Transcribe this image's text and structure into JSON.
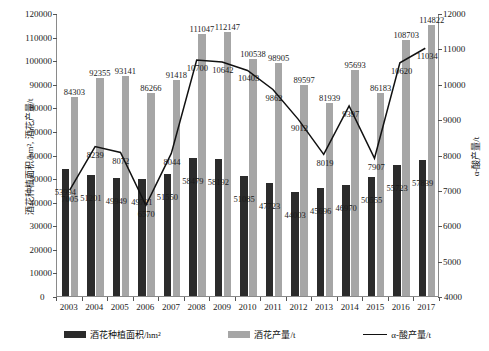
{
  "chart_data": {
    "type": "bar",
    "title": "",
    "xlabel": "",
    "ylabel": "酒花种植面积/hm², 酒花产量/t",
    "ylabel_right": "α-酸产量/t",
    "categories": [
      "2003",
      "2004",
      "2005",
      "2006",
      "2007",
      "2008",
      "2009",
      "2010",
      "2011",
      "2012",
      "2013",
      "2014",
      "2015",
      "2016",
      "2017"
    ],
    "ylim": [
      0,
      120000
    ],
    "yticks": [
      0,
      10000,
      20000,
      30000,
      40000,
      50000,
      60000,
      70000,
      80000,
      90000,
      100000,
      110000,
      120000
    ],
    "ylim_right": [
      4000,
      12000
    ],
    "yticks_right": [
      4000,
      5000,
      6000,
      7000,
      8000,
      9000,
      10000,
      11000,
      12000
    ],
    "grid": false,
    "legend_position": "bottom",
    "series": [
      {
        "name": "酒花种植面积/hm²",
        "type": "bar",
        "axis": "left",
        "color": "#2b2b2b",
        "values": [
          53994,
          51201,
          49949,
          49721,
          51550,
          58479,
          58192,
          51085,
          47723,
          44003,
          45696,
          46970,
          50555,
          55723,
          57839
        ]
      },
      {
        "name": "酒花产量/t",
        "type": "bar",
        "axis": "left",
        "color": "#a6a6a6",
        "values": [
          84303,
          92355,
          93141,
          86266,
          91418,
          111047,
          112147,
          100538,
          98905,
          89597,
          81939,
          95693,
          86183,
          108703,
          114822
        ]
      },
      {
        "name": "α-酸产量/t",
        "type": "line",
        "axis": "right",
        "color": "#111111",
        "values": [
          7005,
          8239,
          8072,
          6570,
          8044,
          10700,
          10642,
          10403,
          9862,
          9012,
          8019,
          9397,
          7907,
          10620,
          11034
        ]
      }
    ]
  },
  "legend": {
    "items": [
      {
        "label": "酒花种植面积/hm²",
        "marker": "bar-dark"
      },
      {
        "label": "酒花产量/t",
        "marker": "bar-gray"
      },
      {
        "label": "α-酸产量/t",
        "marker": "line-black"
      }
    ]
  },
  "axes": {
    "left_title": "酒花种植面积/hm², 酒花产量/t",
    "right_title": "α-酸产量/t",
    "zero_label": "0",
    "right_base_label": "4000"
  }
}
